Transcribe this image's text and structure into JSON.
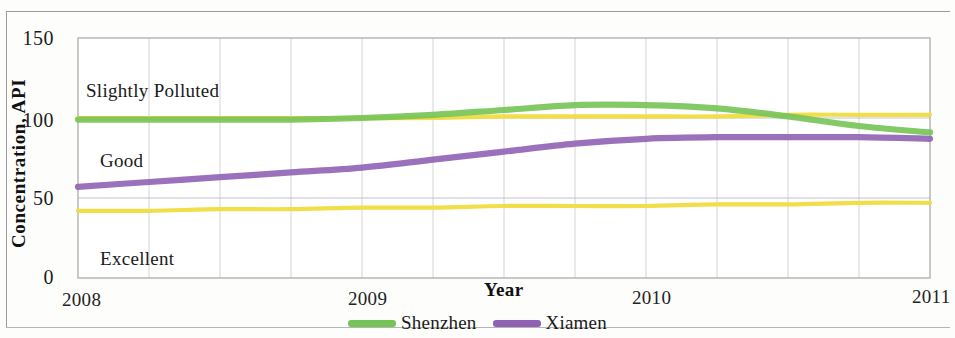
{
  "chart_data": {
    "type": "line",
    "title": "",
    "xlabel": "Year",
    "ylabel": "Concentration, API",
    "xlim": [
      2008,
      2011
    ],
    "ylim": [
      0,
      150
    ],
    "yticks": [
      0,
      50,
      100,
      150
    ],
    "xticks": [
      2008,
      2009,
      2010,
      2011
    ],
    "xtick_labels": [
      "2008",
      "2009",
      "2010",
      "2011"
    ],
    "ytick_labels": [
      "0",
      "50",
      "100",
      "150"
    ],
    "grid": "vertical gridlines at quarter-year intervals; horizontal gridlines at 50 and 100",
    "legend_position": "bottom-center",
    "x": [
      2008.0,
      2008.25,
      2008.5,
      2008.75,
      2009.0,
      2009.25,
      2009.5,
      2009.75,
      2010.0,
      2010.25,
      2010.5,
      2010.75,
      2011.0
    ],
    "series": [
      {
        "name": "Shenzhen",
        "color": "#76c457",
        "values": [
          99,
          99,
          99,
          99,
          100,
          102,
          105,
          108,
          108,
          106,
          101,
          95,
          91
        ]
      },
      {
        "name": "Xiamen",
        "color": "#8f62b3",
        "values": [
          57,
          60,
          63,
          66,
          69,
          74,
          79,
          84,
          87,
          88,
          88,
          88,
          87
        ]
      },
      {
        "name": "Slightly Polluted threshold",
        "color": "#f0dc3f",
        "values": [
          100,
          100,
          100,
          100,
          100,
          100,
          101,
          101,
          101,
          101,
          102,
          102,
          102
        ]
      },
      {
        "name": "Good threshold",
        "color": "#f0dc3f",
        "values": [
          42,
          42,
          43,
          43,
          44,
          44,
          45,
          45,
          45,
          46,
          46,
          47,
          47
        ]
      }
    ],
    "annotations": [
      {
        "text": "Slightly Polluted",
        "x": 2008.08,
        "y": 120
      },
      {
        "text": "Good",
        "x": 2008.1,
        "y": 72
      },
      {
        "text": "Excellent",
        "x": 2008.1,
        "y": 18
      }
    ]
  },
  "axis": {
    "x_title": "Year",
    "y_title": "Concentration, API"
  },
  "legend": {
    "items": [
      {
        "label": "Shenzhen",
        "color": "#76c457"
      },
      {
        "label": "Xiamen",
        "color": "#8f62b3"
      }
    ]
  }
}
